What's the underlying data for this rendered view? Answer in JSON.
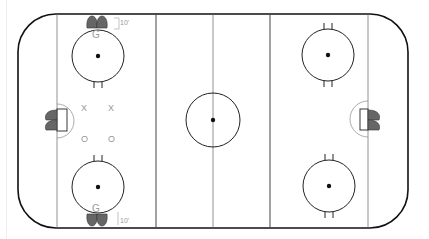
{
  "diagram": {
    "type": "hockey-rink",
    "colors": {
      "board": "#111111",
      "line": "#555555",
      "circle": "#222222",
      "marker": "#666666",
      "label": "#999999"
    },
    "labels": {
      "goalie_top": "G",
      "goalie_bottom": "G",
      "distance_top": "10'",
      "distance_bottom": "10'",
      "x1": "X",
      "x2": "X",
      "o1": "O",
      "o2": "O"
    }
  }
}
